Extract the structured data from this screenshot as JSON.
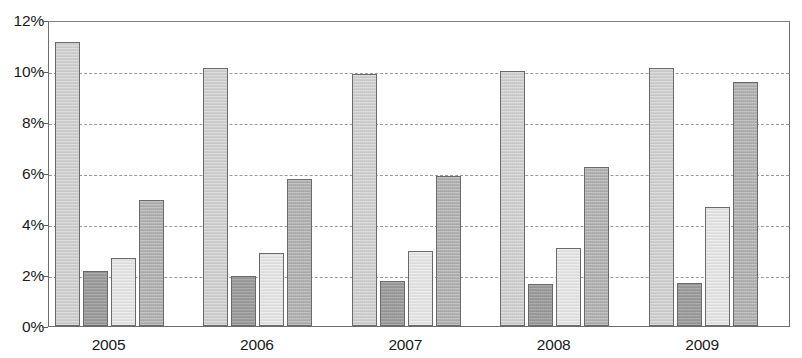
{
  "chart_data": {
    "type": "bar",
    "title": "",
    "subtitle": "",
    "xlabel": "",
    "ylabel": "",
    "categories": [
      "2005",
      "2006",
      "2007",
      "2008",
      "2009"
    ],
    "ylim": [
      0,
      12
    ],
    "ytick_values": [
      0,
      2,
      4,
      6,
      8,
      10,
      12
    ],
    "ytick_labels": [
      "0%",
      "2%",
      "4%",
      "6%",
      "8%",
      "10%",
      "12%"
    ],
    "grid": true,
    "grid_style": "dashed-horizontal",
    "legend": "none",
    "value_format": "percent",
    "series": [
      {
        "name": "series-1",
        "color": "#cfcfcf",
        "values": [
          11.15,
          10.1,
          9.9,
          10.0,
          10.1
        ]
      },
      {
        "name": "series-2",
        "color": "#9c9c9c",
        "values": [
          2.15,
          1.95,
          1.75,
          1.65,
          1.7
        ]
      },
      {
        "name": "series-3",
        "color": "#e4e4e4",
        "values": [
          2.65,
          2.85,
          2.95,
          3.05,
          4.65
        ]
      },
      {
        "name": "series-4",
        "color": "#b2b2b2",
        "values": [
          4.95,
          5.75,
          5.9,
          6.25,
          9.55
        ]
      }
    ]
  },
  "axis": {
    "y_tick_0": "0%",
    "y_tick_1": "2%",
    "y_tick_2": "4%",
    "y_tick_3": "6%",
    "y_tick_4": "8%",
    "y_tick_5": "10%",
    "y_tick_6": "12%",
    "x_tick_0": "2005",
    "x_tick_1": "2006",
    "x_tick_2": "2007",
    "x_tick_3": "2008",
    "x_tick_4": "2009"
  }
}
